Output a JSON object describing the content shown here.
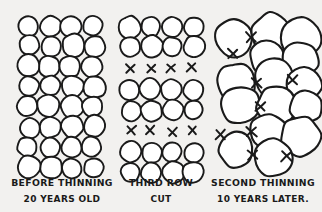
{
  "figure": {
    "title_present": false,
    "background_color": "#f2f1ef",
    "ink_color": "#1a1a1a",
    "crown_fill": "#ffffff"
  },
  "panels": [
    {
      "id": "before-thinning",
      "caption_line1": "BEFORE  THINNING",
      "caption_line2": "20 YEARS OLD",
      "layout": "grid",
      "columns": 4,
      "rows": 8,
      "crown_count": 32,
      "crown_radius": 10.5,
      "x_marks": 0,
      "origin_x": 28,
      "origin_y": 26,
      "col_step": 21.5,
      "row_step": 20.2,
      "caption_x": 62,
      "caption_y1": 186,
      "caption_y2": 202
    },
    {
      "id": "third-row-cut",
      "caption_line1": "THIRD ROW",
      "caption_line2": "CUT",
      "layout": "banded-grid",
      "columns": 4,
      "crown_count": 24,
      "crown_radius": 10.2,
      "x_marks": 8,
      "origin_x": 130,
      "col_step": 21.0,
      "band_rows_y": [
        27,
        47,
        90,
        110,
        152,
        172
      ],
      "x_rows_y": [
        68,
        131
      ],
      "caption_x": 161,
      "caption_y1": 186,
      "caption_y2": 202
    },
    {
      "id": "second-thinning",
      "caption_line1": "SECOND THINNING",
      "caption_line2": "10 YEARS LATER.",
      "layout": "clusters",
      "cluster_count": 3,
      "crown_count": 15,
      "crown_radius_mean": 17,
      "x_marks": 8,
      "caption_x": 263,
      "caption_y1": 186,
      "caption_y2": 202
    }
  ],
  "legend_semantics": {
    "circle": "tree crown",
    "x": "tree marked for cutting"
  }
}
